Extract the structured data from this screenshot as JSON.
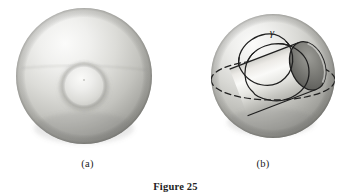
{
  "figure": {
    "caption": "Figure 25",
    "background_color": "#ffffff",
    "ink_color": "#1a1a1a"
  },
  "panels": [
    {
      "id": "a",
      "label": "(a)",
      "description": "shaded sphere with a small circular dimple at center",
      "sphere": {
        "cx": 84,
        "cy": 76,
        "r": 68,
        "light_color": "#f2f2f0",
        "mid_color": "#c9c9c5",
        "shadow_color": "#8e8e8a"
      },
      "dimple": {
        "cx": 84,
        "cy": 86,
        "r": 24
      }
    },
    {
      "id": "b",
      "label": "(b)",
      "description": "shaded sphere with a handle (tube) passing through it, a dashed equator great circle, and a solid closed curve gamma looping around the tube",
      "sphere": {
        "cx": 273,
        "cy": 76,
        "r": 62,
        "light_color": "#efefed",
        "mid_color": "#c6c6c2",
        "shadow_color": "#878783"
      },
      "curve_label": "γ",
      "curve_label_x": 272,
      "curve_label_y": 33,
      "equator": {
        "style": "dashed",
        "cx": 273,
        "cy": 80,
        "rx": 62,
        "ry": 20
      },
      "tube": {
        "style": "solid",
        "opening_fill": "#6f6f6b",
        "axis_angle_deg": -22
      }
    }
  ],
  "colors": {
    "paper": "#ffffff",
    "line": "#1a1a1a",
    "sphere_highlight": "#f4f4f2",
    "sphere_shadow": "#85857f",
    "hole_dark": "#5d5d59"
  }
}
